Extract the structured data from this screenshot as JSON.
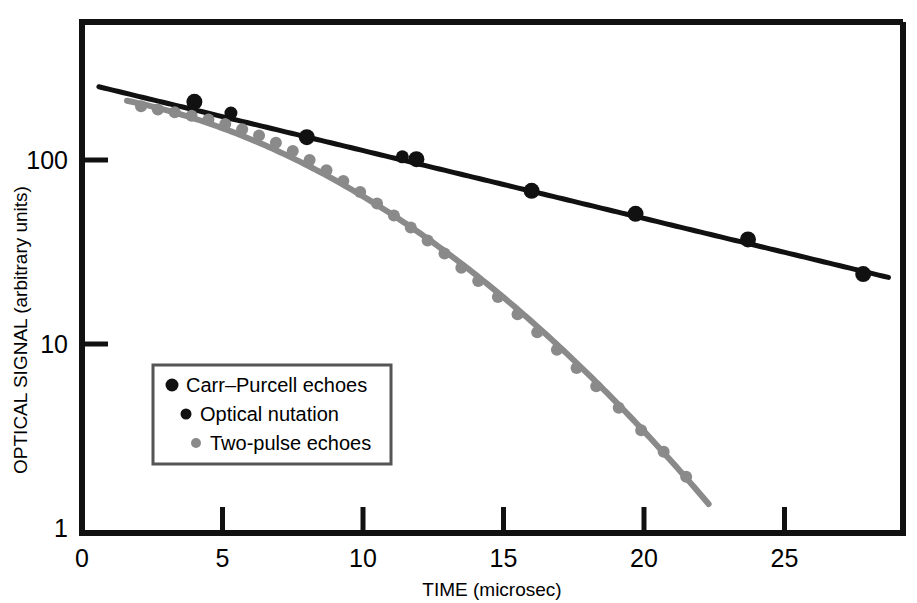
{
  "chart_data": {
    "type": "scatter",
    "title": "",
    "xlabel": "TIME (microsec)",
    "ylabel": "OPTICAL SIGNAL (arbitrary units)",
    "xlim": [
      0,
      29.3
    ],
    "ylim": [
      1,
      420
    ],
    "yscale": "log",
    "xscale": "linear",
    "grid": false,
    "xticks": [
      0,
      5,
      10,
      15,
      20,
      25
    ],
    "xtick_labels": [
      "0",
      "5",
      "10",
      "15",
      "20",
      "25"
    ],
    "yticks": [
      1,
      10,
      100
    ],
    "ytick_labels": [
      "1",
      "10",
      "100"
    ],
    "legend_position": "lower-left-inside",
    "series": [
      {
        "name": "Carr–Purcell echoes",
        "marker": "circle",
        "marker_size": 11,
        "color": "#111111",
        "fit_line": {
          "type": "exponential",
          "color": "#111111",
          "width": 5,
          "x": [
            0.6,
            28.7
          ],
          "y": [
            250,
            23
          ]
        },
        "points": [
          {
            "x": 4.0,
            "y": 207
          },
          {
            "x": 8.0,
            "y": 133
          },
          {
            "x": 11.9,
            "y": 101
          },
          {
            "x": 16.0,
            "y": 68
          },
          {
            "x": 19.7,
            "y": 51
          },
          {
            "x": 23.7,
            "y": 37
          },
          {
            "x": 27.8,
            "y": 24
          }
        ]
      },
      {
        "name": "Optical nutation",
        "marker": "circle",
        "marker_size": 8,
        "color": "#111111",
        "points": [
          {
            "x": 5.3,
            "y": 180
          },
          {
            "x": 11.4,
            "y": 104
          }
        ]
      },
      {
        "name": "Two-pulse echoes",
        "marker": "circle",
        "marker_size": 7,
        "color": "#8a8a8a",
        "fit_line": {
          "type": "gaussian-decay",
          "color": "#8a8a8a",
          "width": 6,
          "x": [
            1.6,
            22.3
          ],
          "y": [
            210,
            1.35
          ]
        },
        "points": [
          {
            "x": 2.1,
            "y": 196
          },
          {
            "x": 2.7,
            "y": 188
          },
          {
            "x": 3.3,
            "y": 182
          },
          {
            "x": 3.9,
            "y": 174
          },
          {
            "x": 4.5,
            "y": 166
          },
          {
            "x": 5.1,
            "y": 157
          },
          {
            "x": 5.7,
            "y": 147
          },
          {
            "x": 6.3,
            "y": 136
          },
          {
            "x": 6.9,
            "y": 124
          },
          {
            "x": 7.5,
            "y": 112
          },
          {
            "x": 8.1,
            "y": 100
          },
          {
            "x": 8.7,
            "y": 88
          },
          {
            "x": 9.3,
            "y": 77
          },
          {
            "x": 9.9,
            "y": 67
          },
          {
            "x": 10.5,
            "y": 58
          },
          {
            "x": 11.1,
            "y": 50
          },
          {
            "x": 11.7,
            "y": 43
          },
          {
            "x": 12.3,
            "y": 36.5
          },
          {
            "x": 12.9,
            "y": 31
          },
          {
            "x": 13.5,
            "y": 26
          },
          {
            "x": 14.1,
            "y": 22
          },
          {
            "x": 14.8,
            "y": 18
          },
          {
            "x": 15.5,
            "y": 14.5
          },
          {
            "x": 16.2,
            "y": 11.6
          },
          {
            "x": 16.9,
            "y": 9.3
          },
          {
            "x": 17.6,
            "y": 7.4
          },
          {
            "x": 18.3,
            "y": 5.9
          },
          {
            "x": 19.1,
            "y": 4.5
          },
          {
            "x": 19.9,
            "y": 3.4
          },
          {
            "x": 20.7,
            "y": 2.6
          },
          {
            "x": 21.5,
            "y": 1.9
          }
        ]
      }
    ]
  },
  "axes": {
    "x_title": "TIME (microsec)",
    "y_title": "OPTICAL SIGNAL (arbitrary units)"
  },
  "legend": {
    "items": [
      {
        "label": "Carr–Purcell echoes",
        "color": "#111111",
        "dot": 10,
        "indent": 0
      },
      {
        "label": "Optical nutation",
        "color": "#111111",
        "dot": 8,
        "indent": 14
      },
      {
        "label": "Two-pulse echoes",
        "color": "#8a8a8a",
        "dot": 7,
        "indent": 24
      }
    ]
  },
  "colors": {
    "background": "#ffffff",
    "axis": "#111111",
    "series_black": "#111111",
    "series_gray": "#8a8a8a"
  }
}
